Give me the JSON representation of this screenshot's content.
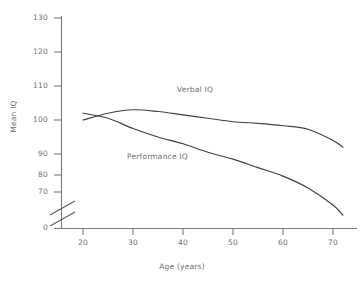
{
  "chart_data": {
    "type": "line",
    "title": "",
    "xlabel": "Age (years)",
    "ylabel": "Mean IQ",
    "xlim": [
      15,
      74
    ],
    "ylim": [
      65,
      133
    ],
    "grid": false,
    "legend_position": "inline-labels",
    "axis_break": {
      "axis": "y",
      "between": [
        0,
        65
      ],
      "symbol": "double-slash"
    },
    "xticks": [
      20,
      30,
      40,
      50,
      60,
      70
    ],
    "xtick_labels": [
      "20",
      "30",
      "40",
      "50",
      "60",
      "70"
    ],
    "yticks": [
      0,
      70,
      80,
      90,
      100,
      110,
      120,
      130
    ],
    "ytick_labels": [
      "0",
      "70",
      "80",
      "90",
      "100",
      "110",
      "120",
      "130"
    ],
    "x": [
      20,
      25,
      30,
      35,
      40,
      45,
      50,
      55,
      60,
      65,
      70,
      72
    ],
    "series": [
      {
        "name": "Verbal IQ",
        "label": "Verbal IQ",
        "color": "#404040",
        "values": [
          100,
          102,
          103,
          102.5,
          101.5,
          100.5,
          99.5,
          99,
          98.3,
          97.3,
          94,
          92
        ]
      },
      {
        "name": "Performance IQ",
        "label": "Performance IQ",
        "color": "#404040",
        "values": [
          102,
          100.5,
          97.5,
          95,
          93,
          90.5,
          88.5,
          86,
          83.5,
          80,
          75,
          72
        ]
      }
    ],
    "annotations": [
      {
        "text": "Verbal IQ",
        "x": 42,
        "y": 106
      },
      {
        "text": "Performance IQ",
        "x": 32,
        "y": 84
      }
    ]
  },
  "axes": {
    "y_title": "Mean IQ",
    "x_title": "Age (years)",
    "y_labels": [
      "130",
      "120",
      "110",
      "100",
      "90",
      "80",
      "70",
      "0"
    ],
    "x_labels": [
      "20",
      "30",
      "40",
      "50",
      "60",
      "70"
    ]
  },
  "labels": {
    "verbal": "Verbal IQ",
    "performance": "Performance IQ"
  }
}
